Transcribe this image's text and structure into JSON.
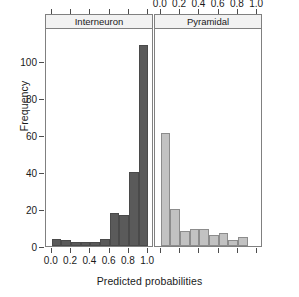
{
  "chart_data": {
    "type": "bar",
    "title": "",
    "subtitle": "",
    "xlabel": "Predicted probabilities",
    "ylabel": "Frequency",
    "ylim": [
      0,
      118
    ],
    "xlim": [
      -0.06,
      1.06
    ],
    "grid": false,
    "legend": "none",
    "layout": "two-panel trellis histogram, shared y-axis",
    "panels": [
      {
        "name": "Interneuron",
        "strip_label": "Interneuron",
        "color": "#5a5a5a",
        "axis_labels_position": "bottom",
        "bin_edges": [
          0.0,
          0.1,
          0.2,
          0.3,
          0.4,
          0.5,
          0.6,
          0.7,
          0.8,
          0.9,
          1.0
        ],
        "bin_centers": [
          0.05,
          0.15,
          0.25,
          0.35,
          0.45,
          0.55,
          0.65,
          0.75,
          0.85,
          0.95
        ],
        "values": [
          4,
          3,
          2,
          2,
          2,
          4,
          18,
          17,
          40,
          109
        ]
      },
      {
        "name": "Pyramidal",
        "strip_label": "Pyramidal",
        "color": "#c2c2c2",
        "axis_labels_position": "top",
        "bin_edges": [
          0.0,
          0.1,
          0.2,
          0.3,
          0.4,
          0.5,
          0.6,
          0.7,
          0.8,
          0.9,
          1.0
        ],
        "bin_centers": [
          0.05,
          0.15,
          0.25,
          0.35,
          0.45,
          0.55,
          0.65,
          0.75,
          0.85,
          0.95
        ],
        "values": [
          61,
          20,
          8,
          9,
          9,
          6,
          7,
          3,
          5,
          0
        ]
      }
    ],
    "yticks": [
      0,
      20,
      40,
      60,
      80,
      100
    ],
    "ytick_labels": [
      "0",
      "20",
      "40",
      "60",
      "80",
      "100"
    ],
    "xticks": [
      0.0,
      0.2,
      0.4,
      0.6,
      0.8,
      1.0
    ],
    "xtick_labels": [
      "0.0",
      "0.2",
      "0.4",
      "0.6",
      "0.8",
      "1.0"
    ]
  }
}
